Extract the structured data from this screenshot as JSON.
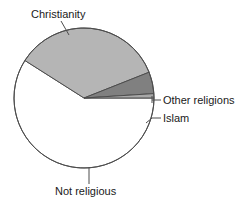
{
  "chart_data": {
    "type": "pie",
    "title": "",
    "subtitle": "",
    "xlabel": "",
    "ylabel": "",
    "legend_position": "none",
    "grid": false,
    "label_style": "callout-leader-lines",
    "categories": [
      "Christianity",
      "Not religious",
      "Islam",
      "Other religions"
    ],
    "values": [
      59,
      35,
      5,
      1
    ],
    "units": "percent",
    "slices": [
      {
        "label": "Christianity",
        "value": 59,
        "color": "#ffffff",
        "stroke": "#4d4d4d",
        "start_angle_deg": 0,
        "end_angle_deg": 212.4,
        "label_position": "top-left",
        "leader": "diagonal"
      },
      {
        "label": "Not religious",
        "value": 35,
        "color": "#b5b5b5",
        "stroke": "#4d4d4d",
        "start_angle_deg": 212.4,
        "end_angle_deg": 338.4,
        "label_position": "bottom",
        "leader": "vertical"
      },
      {
        "label": "Islam",
        "value": 5,
        "color": "#808080",
        "stroke": "#4d4d4d",
        "start_angle_deg": 338.4,
        "end_angle_deg": 356.4,
        "label_position": "right",
        "leader": "horizontal-dash"
      },
      {
        "label": "Other religions",
        "value": 1,
        "color": "#a8a8a8",
        "stroke": "#4d4d4d",
        "start_angle_deg": 356.4,
        "end_angle_deg": 360,
        "label_position": "right",
        "leader": "horizontal-dash"
      }
    ],
    "geometry": {
      "center_x": 84,
      "center_y": 98,
      "radius": 70
    },
    "colors": {
      "outline": "#4d4d4d",
      "text": "#1a1a1a",
      "background": "#ffffff",
      "christianity": "#ffffff",
      "not_religious": "#b5b5b5",
      "islam": "#808080",
      "other_religions": "#a8a8a8"
    }
  },
  "labels": {
    "christianity": "Christianity",
    "not_religious": "Not religious",
    "islam": "Islam",
    "other_religions": "Other religions"
  }
}
